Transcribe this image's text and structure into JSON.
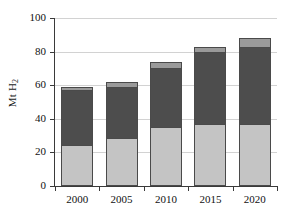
{
  "chart_data": {
    "type": "bar",
    "subtype": "stacked-bar",
    "title": "",
    "xlabel": "",
    "ylabel": "Mt H2",
    "ylabel_display": "Mt H",
    "ylabel_subscript": "2",
    "categories": [
      "2000",
      "2005",
      "2010",
      "2015",
      "2020"
    ],
    "ylim": [
      0,
      100
    ],
    "y_ticks": [
      0,
      20,
      40,
      60,
      80,
      100
    ],
    "y_tick_labels": [
      "0",
      "20",
      "40",
      "60",
      "80",
      "100"
    ],
    "grid": true,
    "grid_axis": "y",
    "legend": "none",
    "series": [
      {
        "name": "segment-bottom",
        "color": "#c4c4c4",
        "values": [
          24.5,
          28.5,
          35.0,
          37.0,
          37.0
        ]
      },
      {
        "name": "segment-middle",
        "color": "#4d4d4d",
        "values": [
          32.5,
          30.5,
          35.0,
          42.5,
          46.0
        ]
      },
      {
        "name": "segment-top",
        "color": "#9a9a9a",
        "values": [
          2.0,
          3.0,
          4.0,
          3.5,
          5.0
        ]
      }
    ],
    "totals": [
      59,
      62,
      74,
      83,
      88
    ]
  }
}
